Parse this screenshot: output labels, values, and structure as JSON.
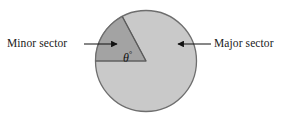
{
  "figure": {
    "labels": {
      "minor_sector": "Minor sector",
      "major_sector": "Major sector",
      "angle_symbol": "θ",
      "angle_degree_mark": "°"
    },
    "colors": {
      "background": "#ffffff",
      "major_sector_fill": "#c9c9c9",
      "minor_sector_fill": "#a3a3a3",
      "outline": "#6e6e6e",
      "radius_line": "#5a5a5a",
      "text": "#1a1a1a",
      "arrow": "#111111"
    },
    "geometry": {
      "circle_center_x": 146,
      "circle_center_y": 61,
      "circle_radius": 51,
      "minor_sector_start_angle_deg": 180,
      "minor_sector_end_angle_deg": 118,
      "minor_sector_sweep_deg": 62
    },
    "annotations": [
      {
        "name": "minor-sector-arrow",
        "from_x": 84,
        "from_y": 44,
        "to_x": 117,
        "to_y": 44,
        "direction": "right"
      },
      {
        "name": "major-sector-arrow",
        "from_x": 211,
        "from_y": 44,
        "to_x": 178,
        "to_y": 44,
        "direction": "left"
      }
    ]
  }
}
